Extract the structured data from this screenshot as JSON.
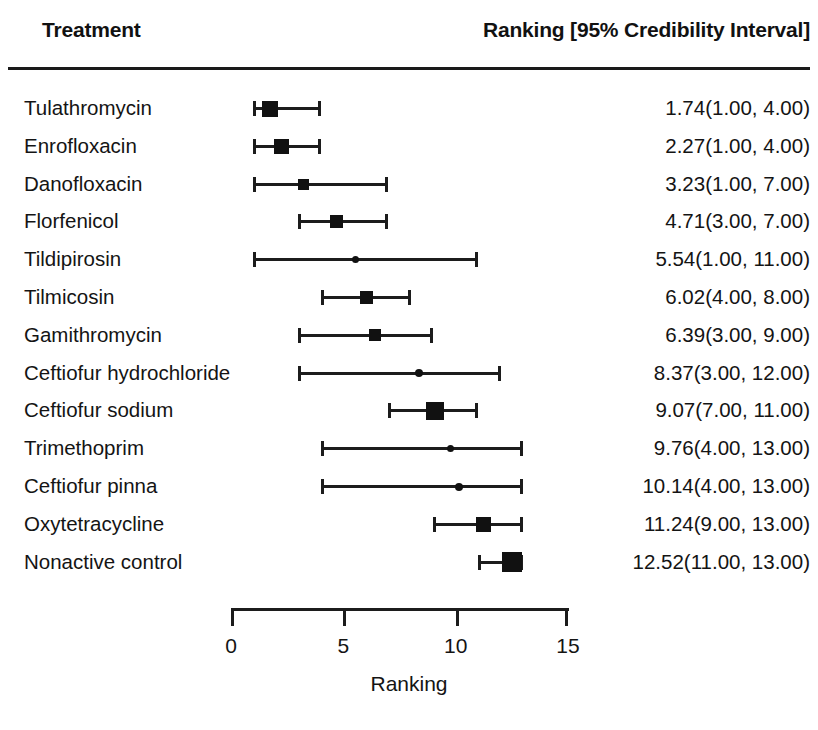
{
  "header": {
    "treatment_label": "Treatment",
    "ranking_label": "Ranking [95% Credibility Interval]"
  },
  "axis": {
    "title": "Ranking",
    "ticks": [
      "0",
      "5",
      "10",
      "15"
    ],
    "tick_values": [
      0,
      5,
      10,
      15
    ],
    "min": 0,
    "max": 15
  },
  "rows": [
    {
      "label": "Tulathromycin",
      "value": "1.74(1.00,  4.00)"
    },
    {
      "label": "Enrofloxacin",
      "value": "2.27(1.00,  4.00)"
    },
    {
      "label": "Danofloxacin",
      "value": "3.23(1.00,  7.00)"
    },
    {
      "label": "Florfenicol",
      "value": "4.71(3.00,  7.00)"
    },
    {
      "label": "Tildipirosin",
      "value": "5.54(1.00, 11.00)"
    },
    {
      "label": "Tilmicosin",
      "value": "6.02(4.00,  8.00)"
    },
    {
      "label": "Gamithromycin",
      "value": "6.39(3.00,  9.00)"
    },
    {
      "label": "Ceftiofur hydrochloride",
      "value": "8.37(3.00, 12.00)"
    },
    {
      "label": "Ceftiofur sodium",
      "value": "9.07(7.00, 11.00)"
    },
    {
      "label": "Trimethoprim",
      "value": "9.76(4.00, 13.00)"
    },
    {
      "label": "Ceftiofur pinna",
      "value": "10.14(4.00, 13.00)"
    },
    {
      "label": "Oxytetracycline",
      "value": "11.24(9.00, 13.00)"
    },
    {
      "label": "Nonactive control",
      "value": "12.52(11.00, 13.00)"
    }
  ],
  "colors": {
    "ink": "#111111",
    "rule": "#1a1a1a",
    "background": "#ffffff"
  },
  "chart_data": {
    "type": "scatter",
    "title": "",
    "subtitle": "",
    "xlabel": "Ranking",
    "ylabel": "",
    "xlim": [
      0,
      15
    ],
    "xticks": [
      0,
      5,
      10,
      15
    ],
    "grid": false,
    "legend": "none",
    "plot_style": "forest-plot",
    "categories": [
      "Tulathromycin",
      "Enrofloxacin",
      "Danofloxacin",
      "Florfenicol",
      "Tildipirosin",
      "Tilmicosin",
      "Gamithromycin",
      "Ceftiofur hydrochloride",
      "Ceftiofur sodium",
      "Trimethoprim",
      "Ceftiofur pinna",
      "Oxytetracycline",
      "Nonactive control"
    ],
    "estimates": [
      1.74,
      2.27,
      3.23,
      4.71,
      5.54,
      6.02,
      6.39,
      8.37,
      9.07,
      9.76,
      10.14,
      11.24,
      12.52
    ],
    "ci_lower": [
      1.0,
      1.0,
      1.0,
      3.0,
      1.0,
      4.0,
      3.0,
      3.0,
      7.0,
      4.0,
      4.0,
      9.0,
      11.0
    ],
    "ci_upper": [
      4.0,
      4.0,
      7.0,
      7.0,
      11.0,
      8.0,
      9.0,
      12.0,
      11.0,
      13.0,
      13.0,
      13.0,
      13.0
    ],
    "marker_sizes": [
      16,
      15,
      11,
      13,
      7,
      13,
      12,
      8,
      18,
      7,
      8,
      15,
      20
    ],
    "marker_shapes": [
      "square",
      "square",
      "square",
      "square",
      "circle",
      "square",
      "square",
      "circle",
      "square",
      "circle",
      "circle",
      "square",
      "square"
    ]
  }
}
